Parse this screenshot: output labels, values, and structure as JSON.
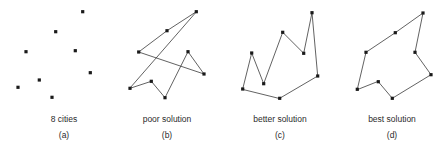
{
  "figure": {
    "name": "traveling-salesman-tour-quality-comparison",
    "width": 445,
    "height": 157,
    "background_color": "#ffffff",
    "node_color": "#1a1a1a",
    "edge_color": "#3a3a3a",
    "caption_color": "#2b2b2b"
  },
  "panels": [
    {
      "id": "a",
      "title": "8 cities",
      "letter": "(a)",
      "caption_x": 64,
      "caption_y": 113,
      "has_tour": false,
      "cities": [
        {
          "x": 82.7,
          "y": 11.7
        },
        {
          "x": 55.7,
          "y": 31.7
        },
        {
          "x": 75.3,
          "y": 50.7
        },
        {
          "x": 26.0,
          "y": 51.7
        },
        {
          "x": 90.3,
          "y": 72.7
        },
        {
          "x": 39.3,
          "y": 80.0
        },
        {
          "x": 18.0,
          "y": 87.3
        },
        {
          "x": 52.0,
          "y": 97.3
        }
      ],
      "tour_order": []
    },
    {
      "id": "b",
      "title": "poor solution",
      "letter": "(b)",
      "caption_x": 167,
      "caption_y": 113,
      "has_tour": true,
      "cities": [
        {
          "x": 196.3,
          "y": 11.7
        },
        {
          "x": 167.0,
          "y": 30.7
        },
        {
          "x": 138.7,
          "y": 52.0
        },
        {
          "x": 188.0,
          "y": 51.7
        },
        {
          "x": 204.0,
          "y": 74.0
        },
        {
          "x": 151.3,
          "y": 81.3
        },
        {
          "x": 130.0,
          "y": 88.3
        },
        {
          "x": 165.0,
          "y": 97.7
        }
      ],
      "tour_order": [
        0,
        1,
        2,
        4,
        3,
        7,
        5,
        6
      ]
    },
    {
      "id": "c",
      "title": "better solution",
      "letter": "(c)",
      "caption_x": 280,
      "caption_y": 113,
      "has_tour": true,
      "cities": [
        {
          "x": 312.0,
          "y": 12.7
        },
        {
          "x": 282.7,
          "y": 32.3
        },
        {
          "x": 251.7,
          "y": 53.0
        },
        {
          "x": 303.7,
          "y": 53.3
        },
        {
          "x": 317.7,
          "y": 76.0
        },
        {
          "x": 263.7,
          "y": 83.7
        },
        {
          "x": 242.7,
          "y": 89.0
        },
        {
          "x": 279.7,
          "y": 98.3
        }
      ],
      "tour_order": [
        6,
        2,
        5,
        1,
        3,
        0,
        4,
        7
      ]
    },
    {
      "id": "d",
      "title": "best solution",
      "letter": "(d)",
      "caption_x": 392,
      "caption_y": 113,
      "has_tour": true,
      "cities": [
        {
          "x": 423.0,
          "y": 13.0
        },
        {
          "x": 395.3,
          "y": 32.7
        },
        {
          "x": 366.0,
          "y": 52.3
        },
        {
          "x": 415.0,
          "y": 52.3
        },
        {
          "x": 431.0,
          "y": 74.7
        },
        {
          "x": 378.3,
          "y": 81.7
        },
        {
          "x": 357.3,
          "y": 89.3
        },
        {
          "x": 392.3,
          "y": 98.3
        }
      ],
      "tour_order": [
        6,
        2,
        1,
        0,
        3,
        4,
        7,
        5
      ]
    }
  ]
}
